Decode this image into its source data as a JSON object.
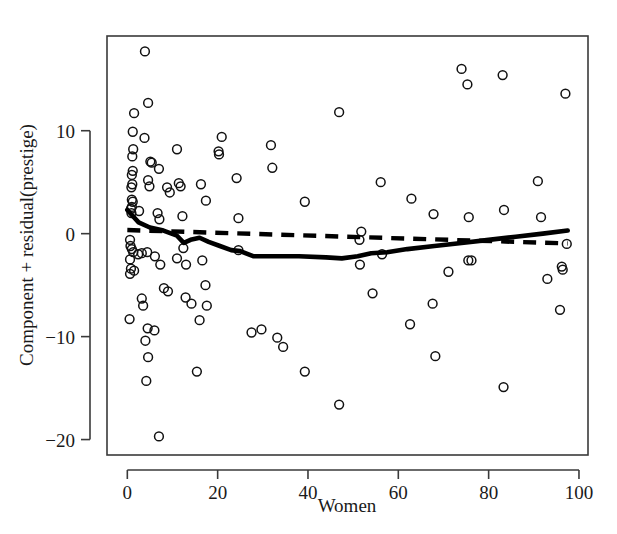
{
  "chart_data": {
    "type": "scatter",
    "title": "",
    "xlabel": "Women",
    "ylabel": "Component + residual(prestige)",
    "xlim": [
      -4.5,
      102
    ],
    "ylim": [
      -21.5,
      19.2
    ],
    "xticks": [
      0,
      20,
      40,
      60,
      80,
      100
    ],
    "yticks": [
      10,
      0,
      -10,
      -20
    ],
    "xtick_labels": [
      "0",
      "20",
      "40",
      "60",
      "80",
      "100"
    ],
    "ytick_labels": [
      "10",
      "0",
      "−10",
      "−20"
    ],
    "grid": false,
    "legend": "none",
    "marker": "open-circle",
    "points": [
      [
        3.9,
        17.7
      ],
      [
        4.6,
        12.7
      ],
      [
        1.5,
        11.7
      ],
      [
        1.2,
        9.9
      ],
      [
        3.8,
        9.3
      ],
      [
        1.3,
        8.2
      ],
      [
        1.1,
        7.5
      ],
      [
        5.1,
        7.0
      ],
      [
        5.4,
        6.9
      ],
      [
        1.2,
        6.1
      ],
      [
        1.0,
        5.7
      ],
      [
        7.0,
        6.3
      ],
      [
        4.6,
        5.2
      ],
      [
        4.9,
        4.6
      ],
      [
        1.1,
        4.8
      ],
      [
        0.9,
        4.5
      ],
      [
        8.8,
        4.5
      ],
      [
        9.4,
        4.0
      ],
      [
        11.4,
        4.9
      ],
      [
        11.8,
        4.6
      ],
      [
        1.0,
        3.3
      ],
      [
        1.2,
        3.1
      ],
      [
        1.0,
        2.6
      ],
      [
        0.8,
        2.4
      ],
      [
        0.9,
        2.0
      ],
      [
        2.6,
        2.2
      ],
      [
        6.7,
        2.0
      ],
      [
        7.1,
        1.4
      ],
      [
        11.0,
        8.2
      ],
      [
        12.2,
        1.7
      ],
      [
        16.3,
        4.8
      ],
      [
        17.4,
        3.2
      ],
      [
        20.2,
        8.0
      ],
      [
        20.9,
        9.4
      ],
      [
        20.3,
        7.7
      ],
      [
        24.2,
        5.4
      ],
      [
        24.6,
        1.5
      ],
      [
        31.8,
        8.6
      ],
      [
        32.1,
        6.4
      ],
      [
        39.3,
        3.1
      ],
      [
        46.9,
        11.8
      ],
      [
        51.8,
        0.2
      ],
      [
        51.4,
        -0.6
      ],
      [
        56.1,
        5.0
      ],
      [
        62.9,
        3.4
      ],
      [
        67.8,
        1.9
      ],
      [
        74.0,
        16.0
      ],
      [
        75.3,
        14.5
      ],
      [
        75.6,
        1.6
      ],
      [
        83.1,
        15.4
      ],
      [
        83.4,
        2.3
      ],
      [
        90.9,
        5.1
      ],
      [
        91.6,
        1.6
      ],
      [
        97.0,
        13.6
      ],
      [
        0.6,
        -0.6
      ],
      [
        0.7,
        -1.2
      ],
      [
        1.0,
        -1.5
      ],
      [
        1.3,
        -1.8
      ],
      [
        2.4,
        -2.0
      ],
      [
        0.6,
        -2.5
      ],
      [
        3.2,
        -1.9
      ],
      [
        4.4,
        -1.8
      ],
      [
        6.1,
        -2.2
      ],
      [
        7.3,
        -3.0
      ],
      [
        0.8,
        -3.4
      ],
      [
        0.6,
        -3.9
      ],
      [
        1.5,
        -3.6
      ],
      [
        12.4,
        -1.4
      ],
      [
        16.6,
        -2.6
      ],
      [
        11.0,
        -2.4
      ],
      [
        13.0,
        -3.0
      ],
      [
        17.3,
        -5.0
      ],
      [
        12.9,
        -6.2
      ],
      [
        14.2,
        -6.8
      ],
      [
        8.1,
        -5.3
      ],
      [
        9.0,
        -5.6
      ],
      [
        17.6,
        -7.0
      ],
      [
        3.2,
        -6.3
      ],
      [
        3.5,
        -7.0
      ],
      [
        0.5,
        -8.3
      ],
      [
        6.0,
        -9.4
      ],
      [
        4.5,
        -9.2
      ],
      [
        4.0,
        -10.4
      ],
      [
        4.6,
        -12.0
      ],
      [
        4.2,
        -14.3
      ],
      [
        15.4,
        -13.4
      ],
      [
        16.0,
        -8.4
      ],
      [
        27.5,
        -9.6
      ],
      [
        29.7,
        -9.3
      ],
      [
        33.2,
        -10.1
      ],
      [
        34.5,
        -11.0
      ],
      [
        39.3,
        -13.4
      ],
      [
        46.9,
        -16.6
      ],
      [
        24.6,
        -1.6
      ],
      [
        51.5,
        -3.0
      ],
      [
        54.3,
        -5.8
      ],
      [
        56.4,
        -2.0
      ],
      [
        62.6,
        -8.8
      ],
      [
        67.6,
        -6.8
      ],
      [
        68.2,
        -11.9
      ],
      [
        71.1,
        -3.7
      ],
      [
        75.5,
        -2.6
      ],
      [
        76.2,
        -2.6
      ],
      [
        83.3,
        -14.9
      ],
      [
        93.0,
        -4.4
      ],
      [
        96.2,
        -3.2
      ],
      [
        96.4,
        -3.5
      ],
      [
        95.8,
        -7.4
      ],
      [
        97.3,
        -1.0
      ],
      [
        7.0,
        -19.7
      ]
    ],
    "series": [
      {
        "name": "lowess-smooth",
        "style": "solid",
        "points": [
          [
            0,
            2.3
          ],
          [
            2.5,
            1.1
          ],
          [
            5.0,
            0.6
          ],
          [
            8.0,
            0.3
          ],
          [
            11.0,
            -0.2
          ],
          [
            12.5,
            -0.9
          ],
          [
            14.0,
            -0.6
          ],
          [
            16.0,
            -0.4
          ],
          [
            18.0,
            -0.8
          ],
          [
            20.5,
            -1.2
          ],
          [
            23.0,
            -1.6
          ],
          [
            25.0,
            -1.7
          ],
          [
            28.0,
            -2.2
          ],
          [
            32.0,
            -2.2
          ],
          [
            38.0,
            -2.2
          ],
          [
            44.0,
            -2.3
          ],
          [
            47.5,
            -2.4
          ],
          [
            51.0,
            -2.2
          ],
          [
            54.0,
            -1.9
          ],
          [
            57.5,
            -1.8
          ],
          [
            62.0,
            -1.5
          ],
          [
            68.0,
            -1.2
          ],
          [
            74.0,
            -0.9
          ],
          [
            80.0,
            -0.6
          ],
          [
            86.0,
            -0.3
          ],
          [
            92.0,
            0.0
          ],
          [
            97.5,
            0.3
          ]
        ]
      },
      {
        "name": "linear-fit",
        "style": "dashed",
        "points": [
          [
            0,
            0.35
          ],
          [
            97.5,
            -0.95
          ]
        ]
      }
    ]
  }
}
